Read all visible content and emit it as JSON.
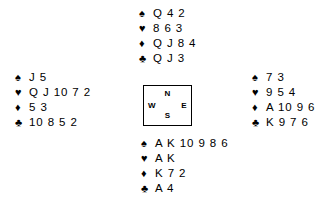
{
  "diagram": {
    "type": "bridge-deal",
    "suit_glyphs": {
      "spade": "♠",
      "heart": "♥",
      "diamond": "♦",
      "club": "♣"
    },
    "compass": {
      "north": "N",
      "east": "E",
      "south": "S",
      "west": "W"
    },
    "hands": {
      "north": {
        "spades": "Q 4 2",
        "hearts": "8 6 3",
        "diamonds": "Q J 8 4",
        "clubs": "Q J 3"
      },
      "west": {
        "spades": "J 5",
        "hearts": "Q J 10 7 2",
        "diamonds": "5 3",
        "clubs": "10 8 5 2"
      },
      "east": {
        "spades": "7 3",
        "hearts": "9 5 4",
        "diamonds": "A 10 9 6",
        "clubs": "K 9 7 6"
      },
      "south": {
        "spades": "A K 10 9 8 6",
        "hearts": "A K",
        "diamonds": "K 7 2",
        "clubs": "A 4"
      }
    },
    "colors": {
      "background": "#ffffff",
      "ink": "#000000"
    }
  }
}
